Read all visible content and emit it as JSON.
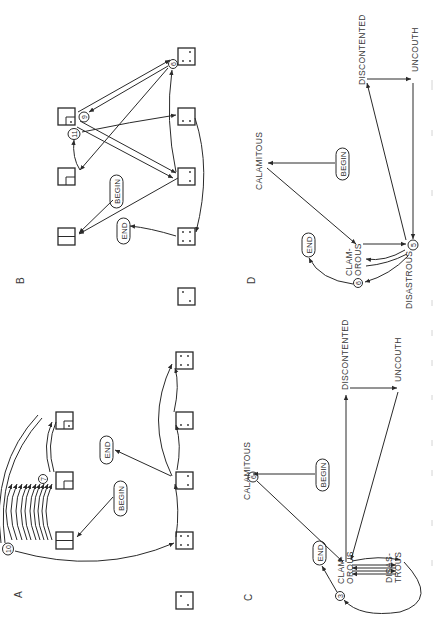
{
  "figure": {
    "orientation": "rotated-90-ccw",
    "panels": {
      "A": {
        "label": "A",
        "begin_label": "BEGIN",
        "end_label": "END",
        "counts": [
          "10",
          "7"
        ]
      },
      "B": {
        "label": "B",
        "begin_label": "BEGIN",
        "end_label": "END",
        "counts": [
          "9",
          "11",
          "6"
        ]
      },
      "C": {
        "label": "C",
        "begin_label": "BEGIN",
        "end_label": "END",
        "words": {
          "calamitous": "CALAMITOUS",
          "clamorous_1": "CLAM-",
          "clamorous_2": "OROUS",
          "disastrous_1": "DISAS-",
          "disastrous_2": "TROUS",
          "discontented": "DISCONTENTED",
          "uncouth": "UNCOUTH"
        },
        "counts": [
          "6",
          "3"
        ]
      },
      "D": {
        "label": "D",
        "begin_label": "BEGIN",
        "end_label": "END",
        "words": {
          "calamitous": "CALAMITOUS",
          "clamorous_1": "CLAM-",
          "clamorous_2": "OROUS",
          "disastrous": "DISASTROUS",
          "discontented": "DISCONTENTED",
          "uncouth": "UNCOUTH"
        },
        "counts": [
          "5",
          "6"
        ]
      }
    }
  }
}
